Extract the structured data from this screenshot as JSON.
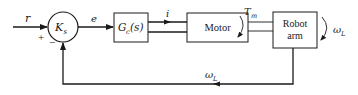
{
  "diagram": {
    "type": "block-diagram",
    "colors": {
      "line": "#1a1a1a",
      "background": "#ffffff"
    },
    "summing_junction": {
      "label": "K",
      "subscript": "s",
      "plus_sign": "+",
      "minus_sign": "−"
    },
    "blocks": [
      {
        "id": "controller",
        "label": "G",
        "subscript": "c",
        "suffix": "(s)"
      },
      {
        "id": "motor",
        "label": "Motor"
      },
      {
        "id": "robot-arm",
        "line1": "Robot",
        "line2": "arm"
      }
    ],
    "signals": {
      "input": "r",
      "error": "e",
      "current": "i",
      "torque": {
        "label": "T",
        "subscript": "m"
      },
      "output": {
        "label": "ω",
        "subscript": "L"
      },
      "feedback": {
        "label": "ω",
        "subscript": "L"
      }
    }
  }
}
